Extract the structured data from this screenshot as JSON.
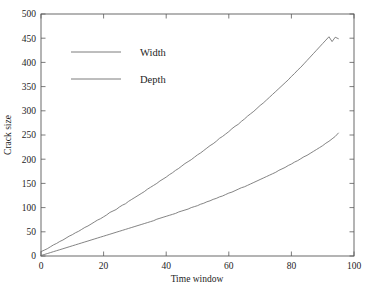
{
  "chart_data": {
    "type": "line",
    "title": "",
    "xlabel": "Time window",
    "ylabel": "Crack size",
    "xlim": [
      0,
      100
    ],
    "ylim": [
      0,
      500
    ],
    "grid": false,
    "legend_position": "upper-left-inside",
    "xticks": [
      0,
      20,
      40,
      60,
      80,
      100
    ],
    "xtick_labels": [
      "0",
      "20",
      "40",
      "60",
      "80",
      "100"
    ],
    "yticks": [
      0,
      50,
      100,
      150,
      200,
      250,
      300,
      350,
      400,
      450,
      500
    ],
    "ytick_labels": [
      "0",
      "50",
      "100",
      "150",
      "200",
      "250",
      "300",
      "350",
      "400",
      "450",
      "500"
    ],
    "line_color": "#6e6e6e",
    "axis_color": "#5a5a5a",
    "background_color": "#ffffff",
    "series": [
      {
        "name": "Width",
        "x": [
          0,
          1,
          2,
          3,
          4,
          5,
          6,
          7,
          8,
          9,
          10,
          11,
          12,
          13,
          14,
          15,
          16,
          17,
          18,
          19,
          20,
          21,
          22,
          23,
          24,
          25,
          26,
          27,
          28,
          29,
          30,
          31,
          32,
          33,
          34,
          35,
          36,
          37,
          38,
          39,
          40,
          41,
          42,
          43,
          44,
          45,
          46,
          47,
          48,
          49,
          50,
          51,
          52,
          53,
          54,
          55,
          56,
          57,
          58,
          59,
          60,
          61,
          62,
          63,
          64,
          65,
          66,
          67,
          68,
          69,
          70,
          71,
          72,
          73,
          74,
          75,
          76,
          77,
          78,
          79,
          80,
          81,
          82,
          83,
          84,
          85,
          86,
          87,
          88,
          89,
          90,
          91,
          92,
          93,
          94,
          95
        ],
        "values": [
          9,
          12,
          15,
          19,
          23,
          26,
          30,
          33,
          37,
          41,
          44,
          48,
          51,
          55,
          59,
          62,
          66,
          70,
          74,
          77,
          81,
          85,
          90,
          93,
          96,
          101,
          105,
          108,
          113,
          117,
          121,
          125,
          129,
          133,
          138,
          142,
          146,
          150,
          155,
          159,
          163,
          168,
          172,
          177,
          181,
          186,
          191,
          195,
          199,
          204,
          209,
          213,
          218,
          223,
          228,
          232,
          237,
          243,
          247,
          252,
          257,
          263,
          268,
          272,
          278,
          283,
          289,
          294,
          299,
          305,
          311,
          316,
          322,
          328,
          334,
          340,
          346,
          352,
          358,
          364,
          371,
          377,
          384,
          390,
          397,
          404,
          411,
          418,
          425,
          432,
          439,
          446,
          453,
          443,
          452,
          449
        ]
      },
      {
        "name": "Depth",
        "x": [
          0,
          1,
          2,
          3,
          4,
          5,
          6,
          7,
          8,
          9,
          10,
          11,
          12,
          13,
          14,
          15,
          16,
          17,
          18,
          19,
          20,
          21,
          22,
          23,
          24,
          25,
          26,
          27,
          28,
          29,
          30,
          31,
          32,
          33,
          34,
          35,
          36,
          37,
          38,
          39,
          40,
          41,
          42,
          43,
          44,
          45,
          46,
          47,
          48,
          49,
          50,
          51,
          52,
          53,
          54,
          55,
          56,
          57,
          58,
          59,
          60,
          61,
          62,
          63,
          64,
          65,
          66,
          67,
          68,
          69,
          70,
          71,
          72,
          73,
          74,
          75,
          76,
          77,
          78,
          79,
          80,
          81,
          82,
          83,
          84,
          85,
          86,
          87,
          88,
          89,
          90,
          91,
          92,
          93,
          94,
          95
        ],
        "values": [
          1,
          3,
          5,
          7,
          9,
          11,
          13,
          15,
          17,
          19,
          21,
          23,
          25,
          27,
          29,
          31,
          33,
          35,
          37,
          39,
          41,
          43,
          45,
          47,
          49,
          51,
          53,
          55,
          57,
          59,
          61,
          63,
          65,
          67,
          69,
          71,
          73,
          76,
          78,
          80,
          82,
          84,
          86,
          88,
          91,
          93,
          95,
          97,
          100,
          102,
          104,
          107,
          109,
          112,
          114,
          117,
          119,
          122,
          124,
          127,
          130,
          132,
          135,
          138,
          141,
          143,
          146,
          149,
          152,
          155,
          158,
          161,
          164,
          167,
          170,
          173,
          177,
          180,
          183,
          187,
          190,
          194,
          197,
          201,
          205,
          208,
          212,
          216,
          220,
          224,
          228,
          233,
          237,
          242,
          247,
          254
        ]
      }
    ],
    "legend": [
      {
        "label": "Width"
      },
      {
        "label": "Depth"
      }
    ]
  }
}
